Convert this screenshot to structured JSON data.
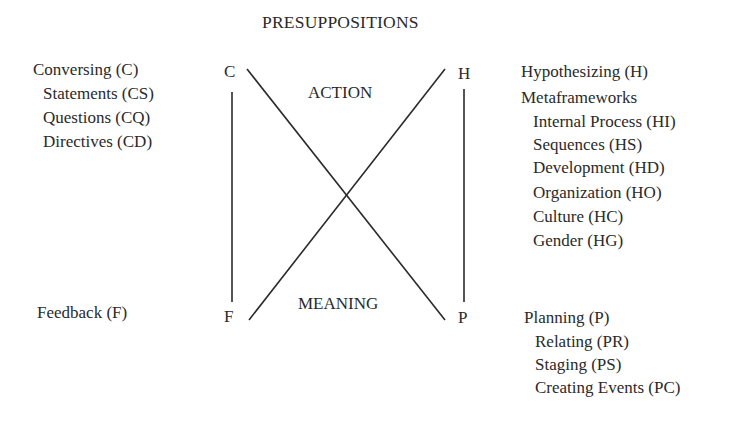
{
  "diagram": {
    "title": "PRESUPPOSITIONS",
    "center_labels": {
      "top": "ACTION",
      "bottom": "MEANING"
    },
    "corners": {
      "top_left": "C",
      "top_right": "H",
      "bottom_left": "F",
      "bottom_right": "P"
    },
    "left_top_list": [
      "Conversing (C)",
      "Statements (CS)",
      "Questions (CQ)",
      "Directives (CD)"
    ],
    "left_bottom_list": [
      "Feedback (F)"
    ],
    "right_top_list": [
      "Hypothesizing (H)",
      "Metaframeworks",
      "Internal Process (HI)",
      "Sequences (HS)",
      "Development (HD)",
      "Organization (HO)",
      "Culture (HC)",
      "Gender (HG)"
    ],
    "right_bottom_list": [
      "Planning (P)",
      "Relating (PR)",
      "Staging (PS)",
      "Creating Events (PC)"
    ],
    "connections": [
      {
        "from": "C",
        "to": "F",
        "type": "vertical"
      },
      {
        "from": "H",
        "to": "P",
        "type": "vertical"
      },
      {
        "from": "C",
        "to": "P",
        "type": "diagonal"
      },
      {
        "from": "F",
        "to": "H",
        "type": "diagonal"
      }
    ],
    "line_color": "#2a2a2a"
  }
}
